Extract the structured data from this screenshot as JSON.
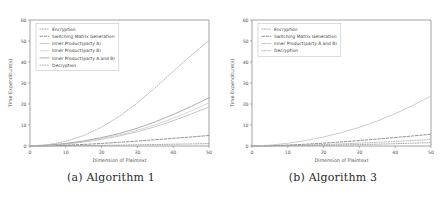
{
  "figure": {
    "subfigures": [
      {
        "caption": "(a) Algorithm 1",
        "caption_tag": "(a)",
        "caption_text": "Algorithm 1"
      },
      {
        "caption": "(b) Algorithm 3",
        "caption_tag": "(b)",
        "caption_text": "Algorithm 3"
      }
    ]
  },
  "chart_data": [
    {
      "type": "line",
      "title": "",
      "subfigure_caption": "(a) Algorithm 1",
      "xlabel": "Dimension of Plaintext",
      "ylabel": "Time Expenditure(s)",
      "xlim": [
        0,
        50
      ],
      "ylim": [
        0,
        60
      ],
      "xticks": [
        0,
        10,
        20,
        30,
        40,
        50
      ],
      "yticks": [
        0,
        10,
        20,
        30,
        40,
        50,
        60
      ],
      "xtick_labels": [
        "0",
        "10",
        "20",
        "30",
        "40",
        "50"
      ],
      "ytick_labels": [
        "0",
        "10",
        "20",
        "30",
        "40",
        "50",
        "60"
      ],
      "grid": false,
      "legend_position": "upper left",
      "x": [
        0,
        5,
        10,
        15,
        20,
        25,
        30,
        35,
        40,
        45,
        50
      ],
      "series": [
        {
          "name": "Encryption",
          "linestyle": "dotted",
          "color": "#9a9a9a",
          "values": [
            0.0,
            0.05,
            0.12,
            0.2,
            0.3,
            0.42,
            0.55,
            0.7,
            0.85,
            1.0,
            1.15
          ]
        },
        {
          "name": "Switching Matrix Generation",
          "linestyle": "dashed",
          "color": "#7f7f7f",
          "values": [
            0.0,
            0.15,
            0.4,
            0.75,
            1.2,
            1.75,
            2.35,
            3.0,
            3.65,
            4.3,
            5.0
          ]
        },
        {
          "name": "Inner Product(party A)",
          "linestyle": "solid",
          "color": "#bdbdbd",
          "values": [
            0.0,
            0.3,
            0.9,
            1.9,
            3.2,
            4.8,
            6.8,
            9.2,
            12.0,
            15.2,
            18.6
          ]
        },
        {
          "name": "Inner Product(party B)",
          "linestyle": "solid",
          "color": "#cfcfcf",
          "values": [
            0.0,
            0.35,
            1.0,
            2.1,
            3.5,
            5.3,
            7.5,
            10.1,
            13.2,
            16.7,
            20.5
          ]
        },
        {
          "name": "Inner Product(party A and B)",
          "linestyle": "solid",
          "color": "#9e9e9e",
          "values": [
            0.0,
            0.4,
            1.2,
            2.4,
            4.0,
            6.0,
            8.5,
            11.5,
            15.0,
            18.8,
            23.0
          ]
        },
        {
          "name": "Decryption",
          "linestyle": "dotted",
          "color": "#a8a8a8",
          "values": [
            0.0,
            0.6,
            2.2,
            5.0,
            9.0,
            14.2,
            20.5,
            27.8,
            35.5,
            43.2,
            50.2
          ]
        }
      ]
    },
    {
      "type": "line",
      "title": "",
      "subfigure_caption": "(b) Algorithm 3",
      "xlabel": "Dimension of Plaintext",
      "ylabel": "Time Expenditure(s)",
      "xlim": [
        0,
        50
      ],
      "ylim": [
        0,
        60
      ],
      "xticks": [
        0,
        10,
        20,
        30,
        40,
        50
      ],
      "yticks": [
        0,
        10,
        20,
        30,
        40,
        50,
        60
      ],
      "xtick_labels": [
        "0",
        "10",
        "20",
        "30",
        "40",
        "50"
      ],
      "ytick_labels": [
        "0",
        "10",
        "20",
        "30",
        "40",
        "50",
        "60"
      ],
      "grid": false,
      "legend_position": "upper left",
      "x": [
        0,
        5,
        10,
        15,
        20,
        25,
        30,
        35,
        40,
        45,
        50
      ],
      "series": [
        {
          "name": "Encryption",
          "linestyle": "dotted",
          "color": "#9a9a9a",
          "values": [
            0.0,
            0.05,
            0.12,
            0.22,
            0.35,
            0.5,
            0.68,
            0.88,
            1.1,
            1.35,
            1.6
          ]
        },
        {
          "name": "Switching Matrix Generation",
          "linestyle": "dashed",
          "color": "#7f7f7f",
          "values": [
            0.0,
            0.15,
            0.45,
            0.85,
            1.35,
            1.95,
            2.6,
            3.3,
            4.05,
            4.8,
            5.6
          ]
        },
        {
          "name": "Inner Product(party A and B)",
          "linestyle": "solid",
          "color": "#c2c2c2",
          "values": [
            0.0,
            0.4,
            1.3,
            2.6,
            4.3,
            6.4,
            8.9,
            11.9,
            15.4,
            19.4,
            23.8
          ]
        },
        {
          "name": "Decryption",
          "linestyle": "dotted",
          "color": "#a8a8a8",
          "values": [
            0.0,
            0.1,
            0.25,
            0.45,
            0.7,
            1.0,
            1.35,
            1.75,
            2.2,
            2.65,
            3.1
          ]
        }
      ]
    }
  ]
}
